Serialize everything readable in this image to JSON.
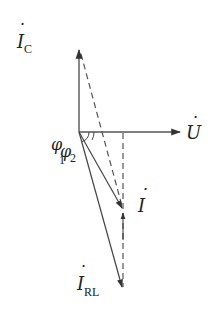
{
  "diagram": {
    "type": "phasor-diagram",
    "origin": {
      "x": 79,
      "y": 132
    },
    "phasors": [
      {
        "id": "U",
        "label": "U",
        "subscript": "",
        "dot": true,
        "tip": {
          "x": 180,
          "y": 132
        },
        "style": "solid"
      },
      {
        "id": "IC",
        "label": "I",
        "subscript": "C",
        "dot": true,
        "tip": {
          "x": 79,
          "y": 50
        },
        "style": "solid"
      },
      {
        "id": "I",
        "label": "I",
        "subscript": "",
        "dot": true,
        "tip": {
          "x": 123,
          "y": 210
        },
        "style": "solid"
      },
      {
        "id": "IRL",
        "label": "I",
        "subscript": "RL",
        "dot": true,
        "tip": {
          "x": 123,
          "y": 288
        },
        "style": "solid"
      }
    ],
    "dashed_lines": [
      {
        "from": "IC-tip",
        "to": "I-tip"
      },
      {
        "from": "U-axis-projection",
        "to": "IRL-tip",
        "arrow_at": "I-tip"
      }
    ],
    "angles": [
      {
        "label": "φ",
        "subscript": "1",
        "between": [
          "U",
          "IRL"
        ]
      },
      {
        "label": "φ",
        "subscript": "2",
        "between": [
          "U",
          "I"
        ]
      }
    ],
    "stroke_color": "#444444"
  },
  "labels": {
    "u": "U",
    "ic_main": "I",
    "ic_sub": "C",
    "i_main": "I",
    "irl_main": "I",
    "irl_sub": "RL",
    "phi1_main": "φ",
    "phi1_sub": "1",
    "phi2_main": "φ",
    "phi2_sub": "2",
    "dot": "·"
  }
}
